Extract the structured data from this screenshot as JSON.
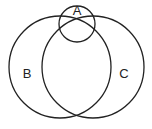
{
  "diagram": {
    "type": "venn",
    "sets": [
      {
        "id": "A",
        "label": "A",
        "cx": 77,
        "cy": 24,
        "r": 18,
        "label_x": 77,
        "label_y": 15
      },
      {
        "id": "B",
        "label": "B",
        "cx": 60,
        "cy": 67,
        "r": 51,
        "label_x": 27,
        "label_y": 78
      },
      {
        "id": "C",
        "label": "C",
        "cx": 93,
        "cy": 67,
        "r": 51,
        "label_x": 124,
        "label_y": 78
      }
    ],
    "stroke_color": "#222222",
    "background": "#ffffff"
  }
}
